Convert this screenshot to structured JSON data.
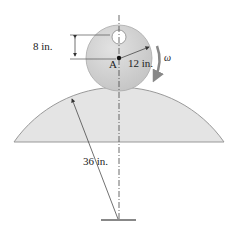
{
  "labels": {
    "offset": "8 in.",
    "radius_small": "12 in.",
    "radius_large": "36 in.",
    "point": "A",
    "omega": "ω"
  },
  "colors": {
    "disk_fill": "#cfcfcf",
    "surface_fill": "#e4e4e4",
    "line": "#333333",
    "arrow_gray": "#8a8a8a"
  }
}
